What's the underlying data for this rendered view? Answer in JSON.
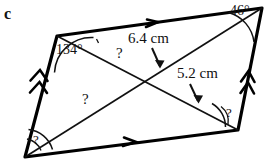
{
  "figure": {
    "part_label": "c",
    "shape_name": "parallelogram",
    "stroke_color": "#000000",
    "fill_color": "#ffffff",
    "background_color": "#ffffff"
  },
  "vertices": {
    "top_left": {
      "x": 57,
      "y": 36
    },
    "top_right": {
      "x": 262,
      "y": 8
    },
    "bottom_right": {
      "x": 238,
      "y": 130
    },
    "bottom_left": {
      "x": 25,
      "y": 157
    }
  },
  "labels": {
    "angle_top_left": "134°",
    "angle_top_right": "46°",
    "length_diagonal_upper": "6.4 cm",
    "length_diagonal_lower": "5.2 cm",
    "unknown_1": "?",
    "unknown_2": "?",
    "unknown_3": "?",
    "unknown_4": "?"
  },
  "tick_marks": {
    "top_side": "single-chevron",
    "bottom_side": "single-chevron",
    "left_side": "double-chevron",
    "right_side": "double-chevron"
  }
}
